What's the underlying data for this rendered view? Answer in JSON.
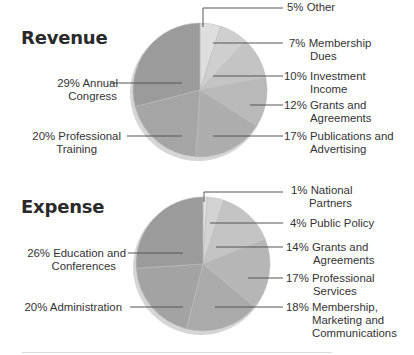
{
  "chart_data": [
    {
      "type": "pie",
      "title": "Revenue",
      "start_angle_deg": 0,
      "direction": "clockwise",
      "slices": [
        {
          "label": "Other",
          "value": 5,
          "color": "#dedede"
        },
        {
          "label": "Membership Dues",
          "value": 7,
          "color": "#cfcfcf"
        },
        {
          "label": "Investment Income",
          "value": 10,
          "color": "#c4c4c4"
        },
        {
          "label": "Grants and Agreements",
          "value": 12,
          "color": "#b9b9b9"
        },
        {
          "label": "Publications and Advertising",
          "value": 17,
          "color": "#adadad"
        },
        {
          "label": "Professional Training",
          "value": 20,
          "color": "#a5a5a5"
        },
        {
          "label": "Annual Congress",
          "value": 29,
          "color": "#9b9b9b"
        }
      ],
      "labels": [
        {
          "text": "5% Other",
          "side": "right"
        },
        {
          "text": "7% Membership\n      Dues",
          "side": "right"
        },
        {
          "text": "10% Investment\n       Income",
          "side": "right"
        },
        {
          "text": "12% Grants and\n       Agreements",
          "side": "right"
        },
        {
          "text": "17% Publications and\n       Advertising",
          "side": "right"
        },
        {
          "text": "20% Professional\nTraining",
          "side": "left"
        },
        {
          "text": "29% Annual\nCongress",
          "side": "left"
        }
      ]
    },
    {
      "type": "pie",
      "title": "Expense",
      "start_angle_deg": 0,
      "direction": "clockwise",
      "slices": [
        {
          "label": "National Partners",
          "value": 1,
          "color": "#e2e2e2"
        },
        {
          "label": "Public Policy",
          "value": 4,
          "color": "#d3d3d3"
        },
        {
          "label": "Grants and Agreements",
          "value": 14,
          "color": "#c4c4c4"
        },
        {
          "label": "Professional Services",
          "value": 17,
          "color": "#b6b6b6"
        },
        {
          "label": "Membership, Marketing and Communications",
          "value": 18,
          "color": "#aaaaaa"
        },
        {
          "label": "Administration",
          "value": 20,
          "color": "#a3a3a3"
        },
        {
          "label": "Education and Conferences",
          "value": 26,
          "color": "#9b9b9b"
        }
      ],
      "labels": [
        {
          "text": "1% National\n     Partners",
          "side": "right"
        },
        {
          "text": "4% Public Policy",
          "side": "right"
        },
        {
          "text": "14% Grants and\n       Agreements",
          "side": "right"
        },
        {
          "text": "17% Professional\n       Services",
          "side": "right"
        },
        {
          "text": "18% Membership,\n       Marketing and\n       Communications",
          "side": "right"
        },
        {
          "text": "20% Administration",
          "side": "left"
        },
        {
          "text": "26% Education and\nConferences",
          "side": "left"
        }
      ]
    }
  ],
  "revenue": {
    "title": "Revenue",
    "labels": {
      "other": "5% Other",
      "membership_1": "7% Membership",
      "membership_2": "Dues",
      "investment_1": "10% Investment",
      "investment_2": "Income",
      "grants_1": "12% Grants and",
      "grants_2": "Agreements",
      "publications_1": "17% Publications and",
      "publications_2": "Advertising",
      "training_1": "20% Professional",
      "training_2": "Training",
      "congress_1": "29% Annual",
      "congress_2": "Congress"
    }
  },
  "expense": {
    "title": "Expense",
    "labels": {
      "national_1": "1% National",
      "national_2": "Partners",
      "policy": "4% Public Policy",
      "grants_1": "14% Grants and",
      "grants_2": "Agreements",
      "services_1": "17% Professional",
      "services_2": "Services",
      "membership_1": "18% Membership,",
      "membership_2": "Marketing and",
      "membership_3": "Communications",
      "admin": "20% Administration",
      "education_1": "26% Education and",
      "education_2": "Conferences"
    }
  }
}
